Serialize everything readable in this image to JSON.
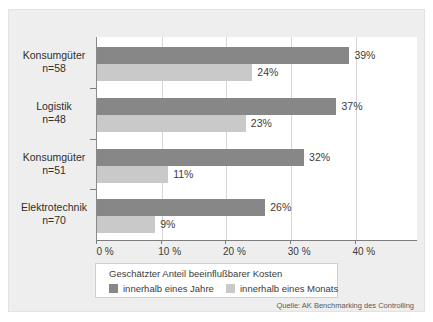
{
  "chart_data": {
    "type": "bar",
    "orientation": "horizontal",
    "title": "",
    "xlabel": "",
    "ylabel": "",
    "xlim": [
      0,
      49.6
    ],
    "xticks": [
      0,
      10,
      20,
      30,
      40
    ],
    "xtick_labels": [
      "0 %",
      "10 %",
      "20 %",
      "30 %",
      "40 %"
    ],
    "grid": true,
    "grid_axis": "x",
    "legend_position": "bottom",
    "legend_title": "Geschätzter Anteil beeinflußbarer Kosten",
    "categories": [
      "Konsumgüter n=58",
      "Logistik n=48",
      "Konsumgüter n=51",
      "Elektrotechnik n=70"
    ],
    "category_names": [
      "Konsumgüter",
      "Logistik",
      "Konsumgüter",
      "Elektrotechnik"
    ],
    "category_counts": [
      "n=58",
      "n=48",
      "n=51",
      "n=70"
    ],
    "series": [
      {
        "name": "innerhalb eines Jahre",
        "color": "#878787",
        "values": [
          39,
          37,
          32,
          26
        ],
        "labels": [
          "39%",
          "37%",
          "32%",
          "26%"
        ]
      },
      {
        "name": "innerhalb eines Monats",
        "color": "#c9c9c9",
        "values": [
          24,
          23,
          11,
          9
        ],
        "labels": [
          "24%",
          "23%",
          "11%",
          "9%"
        ]
      }
    ],
    "source": "Quelle: AK Benchmarking des Controlling"
  },
  "categories": [
    {
      "name": "Konsumgüter",
      "count": "n=58"
    },
    {
      "name": "Logistik",
      "count": "n=48"
    },
    {
      "name": "Konsumgüter",
      "count": "n=51"
    },
    {
      "name": "Elektrotechnik",
      "count": "n=70"
    }
  ],
  "axis": {
    "tick_labels": [
      "0 %",
      "10 %",
      "20 %",
      "30 %",
      "40 %"
    ]
  },
  "legend": {
    "title": "Geschätzter Anteil beeinflußbarer Kosten",
    "entries": [
      {
        "label": "innerhalb eines Jahre",
        "color": "#878787"
      },
      {
        "label": "innerhalb eines Monats",
        "color": "#c9c9c9"
      }
    ]
  },
  "source": {
    "text": "Quelle: AK Benchmarking des Controlling"
  }
}
